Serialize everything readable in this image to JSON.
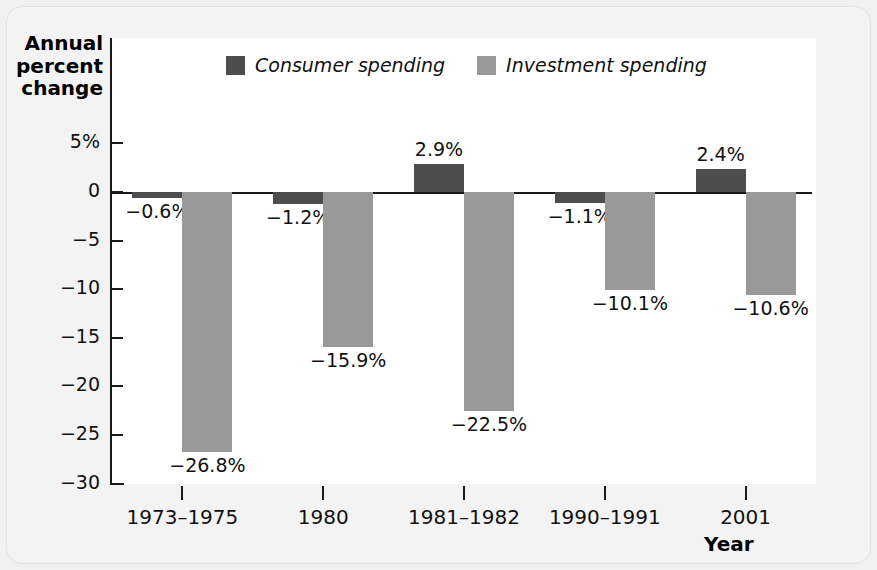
{
  "chart_data": {
    "type": "bar",
    "title": "",
    "xlabel": "Year",
    "ylabel": "Annual percent change",
    "categories": [
      "1973–1975",
      "1980",
      "1981–1982",
      "1990–1991",
      "2001"
    ],
    "series": [
      {
        "name": "Consumer spending",
        "color": "#4d4d4d",
        "values": [
          -0.6,
          -1.2,
          2.9,
          -1.1,
          2.4
        ],
        "value_labels": [
          "−0.6%",
          "−1.2%",
          "2.9%",
          "−1.1%",
          "2.4%"
        ]
      },
      {
        "name": "Investment spending",
        "color": "#999999",
        "values": [
          -26.8,
          -15.9,
          -22.5,
          -10.1,
          -10.6
        ],
        "value_labels": [
          "−26.8%",
          "−15.9%",
          "−22.5%",
          "−10.1%",
          "−10.6%"
        ]
      }
    ],
    "ylim": [
      -30,
      7
    ],
    "yticks": [
      5,
      0,
      -5,
      -10,
      -15,
      -20,
      -25,
      -30
    ],
    "ytick_labels": [
      "5%",
      "0",
      "−5",
      "−10",
      "−15",
      "−20",
      "−25",
      "−30"
    ],
    "grid": false,
    "legend_position": "top-center"
  },
  "axes": {
    "y_title_lines": [
      "Annual",
      "percent",
      "change"
    ],
    "y_title": "Annual percent change",
    "x_title": "Year"
  },
  "legend": {
    "entries": [
      {
        "label": "Consumer spending",
        "color": "#4d4d4d"
      },
      {
        "label": "Investment spending",
        "color": "#999999"
      }
    ]
  }
}
